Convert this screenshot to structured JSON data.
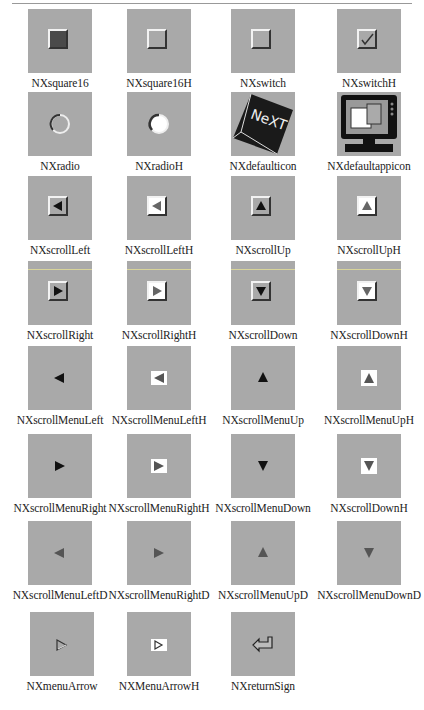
{
  "page": {
    "tile_color": "#a9a9a9"
  },
  "icons": [
    {
      "name": "NXsquare16"
    },
    {
      "name": "NXsquare16H"
    },
    {
      "name": "NXswitch"
    },
    {
      "name": "NXswitchH"
    },
    {
      "name": "NXradio"
    },
    {
      "name": "NXradioH"
    },
    {
      "name": "NXdefaulticon"
    },
    {
      "name": "NXdefaultappicon"
    },
    {
      "name": "NXscrollLeft"
    },
    {
      "name": "NXscrollLeftH"
    },
    {
      "name": "NXscrollUp"
    },
    {
      "name": "NXscrollUpH"
    },
    {
      "name": "NXscrollRight"
    },
    {
      "name": "NXscrollRightH"
    },
    {
      "name": "NXscrollDown"
    },
    {
      "name": "NXscrollDownH"
    },
    {
      "name": "NXscrollMenuLeft"
    },
    {
      "name": "NXscrollMenuLeftH"
    },
    {
      "name": "NXscrollMenuUp"
    },
    {
      "name": "NXscrollMenuUpH"
    },
    {
      "name": "NXscrollMenuRight"
    },
    {
      "name": "NXscrollMenuRightH"
    },
    {
      "name": "NXscrollMenuDown"
    },
    {
      "name": "NXscrollDownH"
    },
    {
      "name": "NXscrollMenuLeftD"
    },
    {
      "name": "NXscrollMenuRightD"
    },
    {
      "name": "NXscrollMenuUpD"
    },
    {
      "name": "NXscrollMenuDownD"
    },
    {
      "name": "NXmenuArrow"
    },
    {
      "name": "NXMenuArrowH"
    },
    {
      "name": "NXreturnSign"
    }
  ]
}
